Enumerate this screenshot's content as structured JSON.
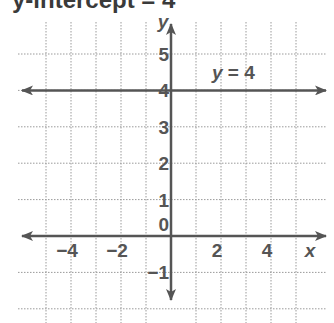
{
  "title": "y-intercept = 4",
  "chart_data": {
    "type": "line",
    "title": "y-intercept = 4",
    "xlabel": "x",
    "ylabel": "y",
    "xlim": [
      -6,
      5.5
    ],
    "ylim": [
      -2,
      5.5
    ],
    "grid": true,
    "x_ticks": [
      -4,
      -2,
      2,
      4
    ],
    "x_tick_labels": [
      "−4",
      "−2",
      "2",
      "4"
    ],
    "y_ticks": [
      -1,
      0,
      1,
      2,
      3,
      4,
      5
    ],
    "y_tick_labels": [
      "−1",
      "0",
      "1",
      "2",
      "3",
      "4",
      "5"
    ],
    "series": [
      {
        "name": "y = 4",
        "x": [
          -6,
          5.5
        ],
        "y": [
          4,
          4
        ],
        "style": "line with arrows both ends"
      }
    ],
    "annotations": [
      {
        "text": "y = 4",
        "x": 2,
        "y": 4.5
      }
    ]
  },
  "colors": {
    "axis": "#555555",
    "grid": "#9a9a9a",
    "text": "#555555"
  }
}
